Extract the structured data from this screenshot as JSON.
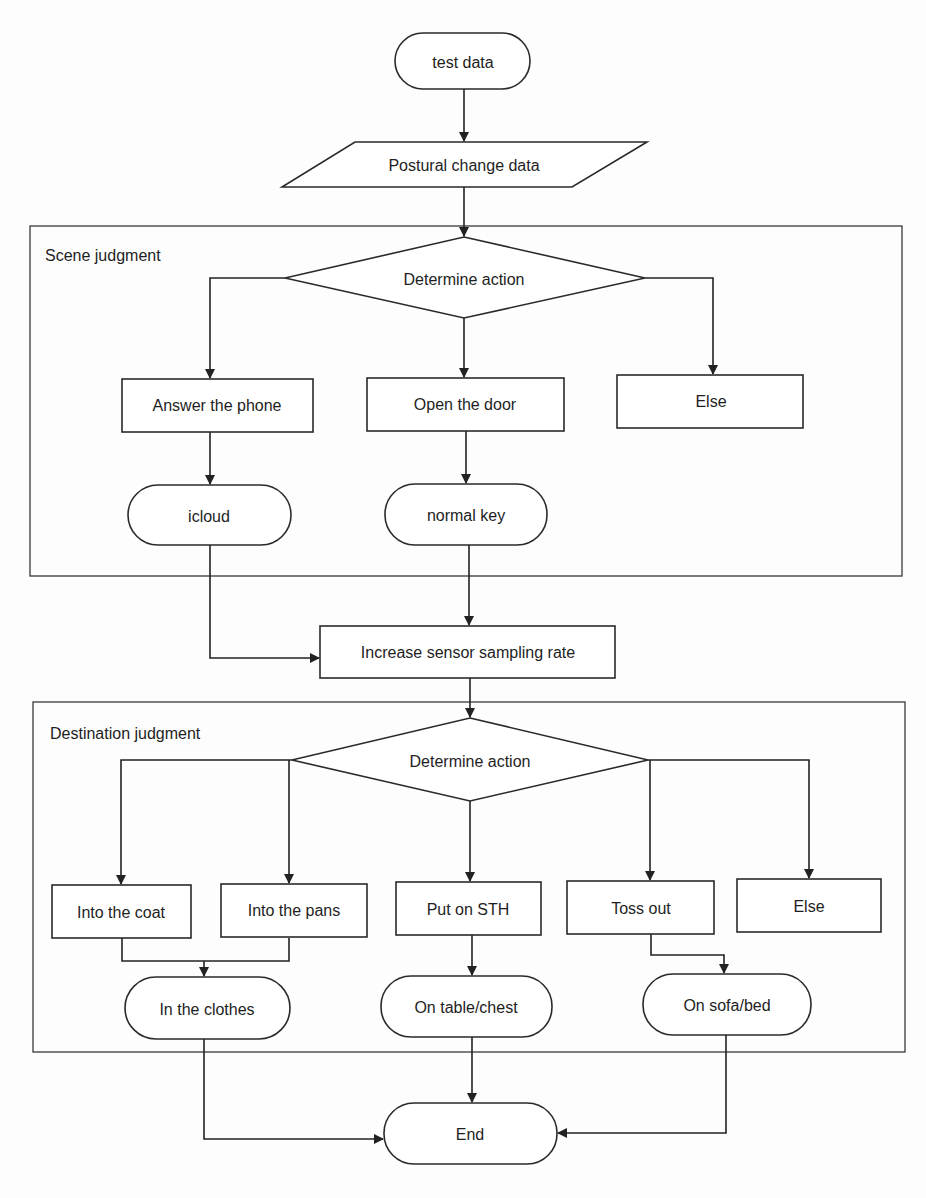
{
  "diagram": {
    "type": "flowchart",
    "start": {
      "label": "test data",
      "shape": "terminator"
    },
    "input": {
      "label": "Postural change data",
      "shape": "parallelogram"
    },
    "groups": [
      {
        "label": "Scene judgment",
        "decision": {
          "label": "Determine action",
          "shape": "diamond"
        },
        "branches": [
          {
            "label": "Answer the phone",
            "result": "icloud"
          },
          {
            "label": "Open the door",
            "result": "normal key"
          },
          {
            "label": "Else",
            "result": null
          }
        ]
      },
      {
        "label": "Destination judgment",
        "decision": {
          "label": "Determine action",
          "shape": "diamond"
        },
        "branches": [
          {
            "label": "Into the coat",
            "result": "In the clothes"
          },
          {
            "label": "Into the pans",
            "result": "In the clothes"
          },
          {
            "label": "Put on STH",
            "result": "On table/chest"
          },
          {
            "label": "Toss out",
            "result": "On sofa/bed"
          },
          {
            "label": "Else",
            "result": null
          }
        ]
      }
    ],
    "process": {
      "label": "Increase sensor sampling rate",
      "shape": "rectangle"
    },
    "end": {
      "label": "End",
      "shape": "terminator"
    },
    "edges": [
      [
        "test data",
        "Postural change data"
      ],
      [
        "Postural change data",
        "Scene judgment: Determine action"
      ],
      [
        "Scene judgment: Determine action",
        "Answer the phone"
      ],
      [
        "Scene judgment: Determine action",
        "Open the door"
      ],
      [
        "Scene judgment: Determine action",
        "Else"
      ],
      [
        "Answer the phone",
        "icloud"
      ],
      [
        "Open the door",
        "normal key"
      ],
      [
        "icloud",
        "Increase sensor sampling rate"
      ],
      [
        "normal key",
        "Increase sensor sampling rate"
      ],
      [
        "Increase sensor sampling rate",
        "Destination judgment: Determine action"
      ],
      [
        "Destination judgment: Determine action",
        "Into the coat"
      ],
      [
        "Destination judgment: Determine action",
        "Into the pans"
      ],
      [
        "Destination judgment: Determine action",
        "Put on STH"
      ],
      [
        "Destination judgment: Determine action",
        "Toss out"
      ],
      [
        "Destination judgment: Determine action",
        "Else"
      ],
      [
        "Into the coat",
        "In the clothes"
      ],
      [
        "Into the pans",
        "In the clothes"
      ],
      [
        "Put on STH",
        "On table/chest"
      ],
      [
        "Toss out",
        "On sofa/bed"
      ],
      [
        "In the clothes",
        "End"
      ],
      [
        "On table/chest",
        "End"
      ],
      [
        "On sofa/bed",
        "End"
      ]
    ]
  },
  "nodes": {
    "test_data": "test data",
    "postural": "Postural change data",
    "scene_label": "Scene judgment",
    "scene_decision": "Determine action",
    "answer_phone": "Answer the phone",
    "open_door": "Open the door",
    "scene_else": "Else",
    "icloud": "icloud",
    "normal_key": "normal key",
    "increase": "Increase sensor sampling rate",
    "dest_label": "Destination judgment",
    "dest_decision": "Determine action",
    "into_coat": "Into the coat",
    "into_pans": "Into the pans",
    "put_on": "Put on STH",
    "toss_out": "Toss out",
    "dest_else": "Else",
    "in_clothes": "In the clothes",
    "on_table": "On table/chest",
    "on_sofa": "On sofa/bed",
    "end": "End"
  }
}
